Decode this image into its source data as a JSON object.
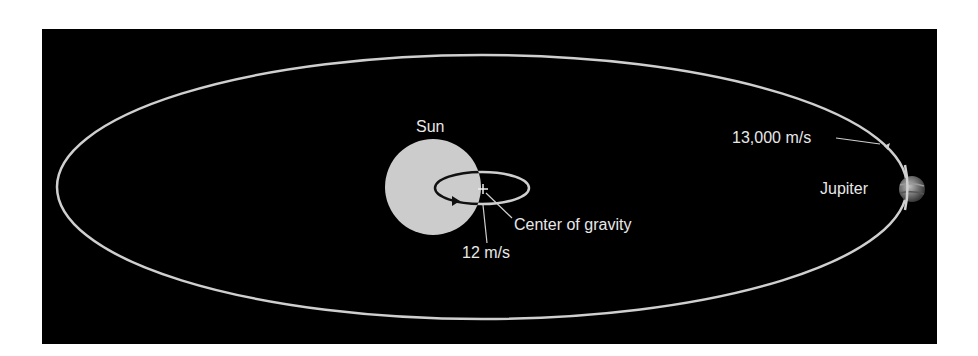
{
  "diagram": {
    "background_color": "#000000",
    "orbit_color": "#cfcfcf",
    "sun": {
      "label": "Sun",
      "color": "#cccccc"
    },
    "jupiter": {
      "label": "Jupiter"
    },
    "labels": {
      "jupiter_speed": "13,000 m/s",
      "sun_speed": "12 m/s",
      "center_of_gravity": "Center of gravity"
    }
  }
}
